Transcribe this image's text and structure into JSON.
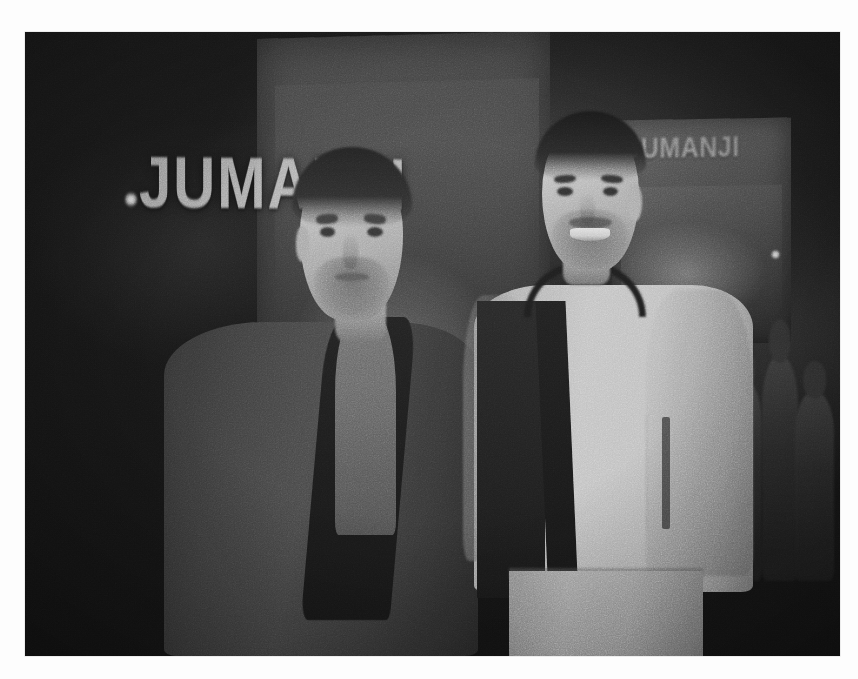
{
  "page": {
    "background_color": "#fdfdfd",
    "type": "photograph"
  },
  "photo": {
    "description": "Grainy black-and-white night photograph of two men posing on a red carpet in front of a JUMANJI film premiere step-and-repeat backdrop",
    "color_mode": "black-and-white",
    "frame": {
      "left": 25,
      "top": 32,
      "width": 815,
      "height": 624
    },
    "palette": {
      "shadow": "#0d0d0d",
      "dark_grey": "#242424",
      "mid_grey": "#6a6a6a",
      "light_grey": "#b0b0b0",
      "highlight": "#c8c8c8",
      "paper_white": "#fdfdfd"
    }
  },
  "backdrop": {
    "main_poster_title": "JUMANJI",
    "right_poster_title": "JUMANJI",
    "top_logo_strip": "Jumanji"
  },
  "subjects": [
    {
      "position": "left",
      "hair": "short dark",
      "facial_hair": "light stubble beard",
      "outerwear": "dark long coat",
      "inner_top": "grey crew-neck t-shirt",
      "expression": "neutral"
    },
    {
      "position": "right",
      "hair": "short dark swept up",
      "facial_hair": "light stubble and moustache",
      "outerwear": "light cream bomber jacket with dark ribbed collar and dark front placket",
      "inner_top": "dark shirt",
      "trousers": "light grey trousers",
      "detail": "vertical zip pocket on left chest",
      "expression": "smiling"
    }
  ],
  "background_elements": {
    "crowd_silhouettes": 6,
    "light_sources": [
      "lamp-left",
      "lamp-right"
    ]
  }
}
